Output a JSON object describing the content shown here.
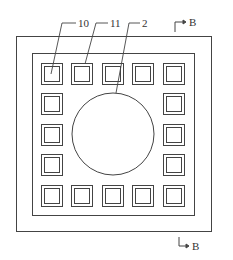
{
  "diagram": {
    "labels": {
      "label_10": "10",
      "label_11": "11",
      "label_2": "2",
      "section_top": "B",
      "section_bottom": "B"
    },
    "line_color": "#444444",
    "grid": {
      "rows": 5,
      "cols": 5,
      "perimeter_only": true,
      "cell_count": 16
    },
    "center_element": "circle"
  }
}
